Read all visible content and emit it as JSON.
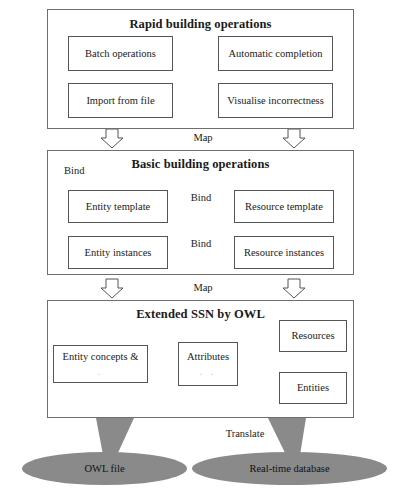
{
  "diagram": {
    "type": "layered-architecture-flow",
    "background": "#ffffff",
    "accent_gray": "#8a8a8a",
    "line_color": "#555555"
  },
  "layers": [
    {
      "id": "rapid",
      "title": "Rapid building operations",
      "boxes": [
        {
          "id": "batch-operations",
          "label": "Batch operations"
        },
        {
          "id": "automatic-completion",
          "label": "Automatic completion"
        },
        {
          "id": "import-from-file",
          "label": "Import from file"
        },
        {
          "id": "visualise-incorrectness",
          "label": "Visualise incorrectness"
        }
      ]
    },
    {
      "id": "basic",
      "title": "Basic building operations",
      "boxes": [
        {
          "id": "entity-template",
          "label": "Entity template"
        },
        {
          "id": "resource-template",
          "label": "Resource template"
        },
        {
          "id": "entity-instances",
          "label": "Entity instances"
        },
        {
          "id": "resource-instances",
          "label": "Resource instances"
        }
      ],
      "self_loop_label": "Bind",
      "link_labels": [
        "Bind",
        "Bind"
      ]
    },
    {
      "id": "extended-ssn",
      "title": "Extended SSN by OWL",
      "boxes": [
        {
          "id": "entity-concepts",
          "label": "Entity concepts &",
          "sub": "."
        },
        {
          "id": "attributes",
          "label": "Attributes",
          "sub": ".      ."
        },
        {
          "id": "resources",
          "label": "Resources"
        },
        {
          "id": "entities",
          "label": "Entities"
        }
      ]
    }
  ],
  "connectors": {
    "map_label_top": "Map",
    "map_label_bottom": "Map",
    "translate_label": "Translate"
  },
  "datastores": [
    {
      "id": "owl-file",
      "label": "OWL file"
    },
    {
      "id": "real-time-database",
      "label": "Real-time database"
    }
  ]
}
